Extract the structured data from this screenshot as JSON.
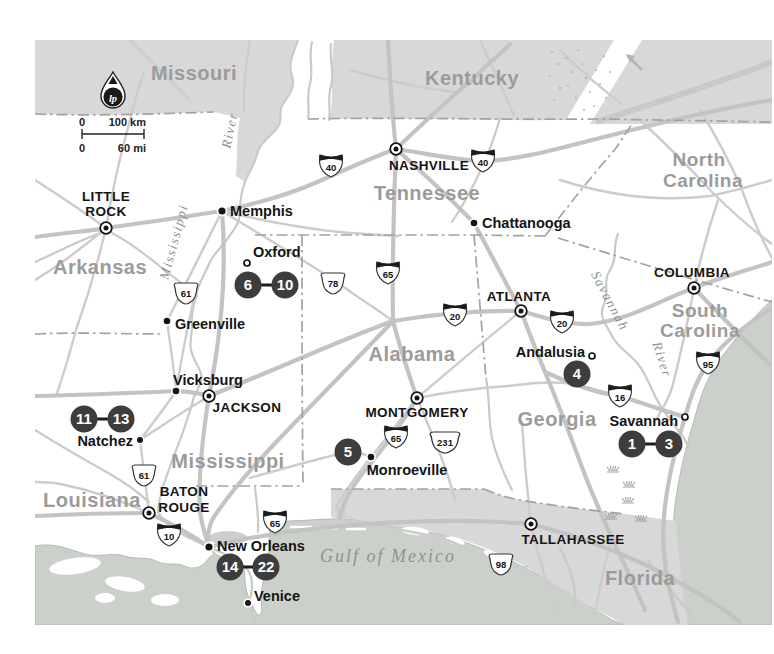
{
  "legend": {
    "logo_text": "lp",
    "scale_km_zero": "0",
    "scale_km": "100 km",
    "scale_mi_zero": "0",
    "scale_mi": "60 mi"
  },
  "states": {
    "missouri": "Missouri",
    "kentucky": "Kentucky",
    "north_carolina_line1": "North",
    "north_carolina_line2": "Carolina",
    "arkansas": "Arkansas",
    "tennessee": "Tennessee",
    "south_carolina_line1": "South",
    "south_carolina_line2": "Carolina",
    "mississippi": "Mississippi",
    "alabama": "Alabama",
    "georgia": "Georgia",
    "louisiana": "Louisiana",
    "florida": "Florida"
  },
  "capitals": {
    "little_rock_line1": "LITTLE",
    "little_rock_line2": "ROCK",
    "nashville": "NASHVILLE",
    "jackson": "JACKSON",
    "montgomery": "MONTGOMERY",
    "atlanta": "ATLANTA",
    "columbia": "COLUMBIA",
    "baton_rouge_line1": "BATON",
    "baton_rouge_line2": "ROUGE",
    "tallahassee": "TALLAHASSEE"
  },
  "cities": {
    "memphis": "Memphis",
    "chattanooga": "Chattanooga",
    "oxford": "Oxford",
    "greenville": "Greenville",
    "vicksburg": "Vicksburg",
    "natchez": "Natchez",
    "monroeville": "Monroeville",
    "andalusia": "Andalusia",
    "savannah": "Savannah",
    "new_orleans": "New Orleans",
    "venice": "Venice"
  },
  "water_labels": {
    "gulf_of_mexico": "Gulf of Mexico",
    "mississippi_river_name": "Mississippi",
    "mississippi_river_word": "River",
    "savannah_river_name": "Savannah",
    "savannah_river_word": "River"
  },
  "route_shields": {
    "i40": "40",
    "i65": "65",
    "i20": "20",
    "i16": "16",
    "i95": "95",
    "i10": "10",
    "us61": "61",
    "us78": "78",
    "us98": "98",
    "us231": "231"
  },
  "site_markers": {
    "m1": "1",
    "m3": "3",
    "m4": "4",
    "m5": "5",
    "m6": "6",
    "m10": "10",
    "m11": "11",
    "m13": "13",
    "m14": "14",
    "m22": "22"
  },
  "colors": {
    "shaded_region": "#d8d8d8",
    "water": "#cbd1ca",
    "road": "#c3c3c3",
    "site_marker": "#3d3d3d",
    "state_label": "#9b9b9b",
    "city_label": "#141414"
  }
}
